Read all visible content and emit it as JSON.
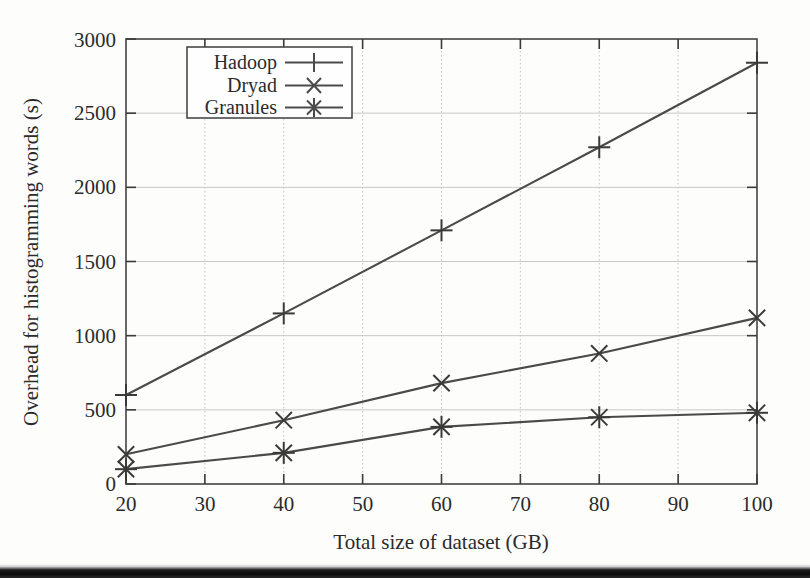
{
  "chart_data": {
    "type": "line",
    "title": "",
    "xlabel": "Total size of dataset (GB)",
    "ylabel": "Overhead for histogramming words (s)",
    "x": [
      20,
      40,
      60,
      80,
      100
    ],
    "xlim": [
      20,
      100
    ],
    "ylim": [
      0,
      3000
    ],
    "xticks": [
      20,
      30,
      40,
      50,
      60,
      70,
      80,
      90,
      100
    ],
    "yticks": [
      0,
      500,
      1000,
      1500,
      2000,
      2500,
      3000
    ],
    "xtick_labels": [
      "20",
      "30",
      "40",
      "50",
      "60",
      "70",
      "80",
      "90",
      "100"
    ],
    "ytick_labels": [
      "0",
      "500",
      "1000",
      "1500",
      "2000",
      "2500",
      "3000"
    ],
    "grid": true,
    "legend_position": "top-left-inside",
    "series": [
      {
        "name": "Hadoop",
        "marker": "plus",
        "values": [
          600,
          1150,
          1710,
          2270,
          2840
        ]
      },
      {
        "name": "Dryad",
        "marker": "cross",
        "values": [
          200,
          430,
          680,
          880,
          1120
        ]
      },
      {
        "name": "Granules",
        "marker": "asterisk",
        "values": [
          100,
          210,
          385,
          450,
          480
        ]
      }
    ],
    "colors": {
      "line": "#4a4a4a",
      "marker": "#3a3a3a",
      "grid": "#c8c8c8",
      "frame": "#444444",
      "text": "#2b2b2b",
      "background": "#fdfdfc"
    }
  },
  "legend": {
    "entries": [
      {
        "label": "Hadoop",
        "marker": "plus-marker"
      },
      {
        "label": "Dryad",
        "marker": "cross-marker"
      },
      {
        "label": "Granules",
        "marker": "asterisk-marker"
      }
    ]
  },
  "axis": {
    "x_title": "Total size of dataset (GB)",
    "y_title": "Overhead for histogramming words (s)"
  },
  "ticks": {
    "x": [
      "20",
      "30",
      "40",
      "50",
      "60",
      "70",
      "80",
      "90",
      "100"
    ],
    "y": [
      "0",
      "500",
      "1000",
      "1500",
      "2000",
      "2500",
      "3000"
    ]
  }
}
